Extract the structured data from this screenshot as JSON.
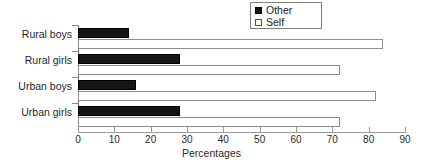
{
  "chart_data": {
    "type": "bar",
    "orientation": "horizontal",
    "title": "",
    "xlabel": "Percentages",
    "ylabel": "",
    "xlim": [
      0,
      90
    ],
    "xticks": [
      0,
      10,
      20,
      30,
      40,
      50,
      60,
      70,
      80,
      90
    ],
    "grid": false,
    "legend_position": "top-right",
    "categories": [
      "Rural boys",
      "Rural girls",
      "Urban boys",
      "Urban girls"
    ],
    "series": [
      {
        "name": "Other",
        "color": "#151515",
        "values": [
          14,
          28,
          16,
          28
        ]
      },
      {
        "name": "Self",
        "color": "#ffffff",
        "values": [
          84,
          72,
          82,
          72
        ]
      }
    ]
  },
  "legend": {
    "items": [
      {
        "label": "Other",
        "marker": "filled-square-icon"
      },
      {
        "label": "Self",
        "marker": "empty-square-icon"
      }
    ]
  }
}
